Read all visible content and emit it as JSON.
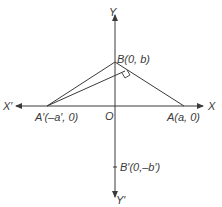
{
  "diagram": {
    "type": "coordinate-geometry",
    "colors": {
      "stroke": "#3a3a3a",
      "text": "#3a3a3a",
      "background": "#ffffff"
    },
    "axes": {
      "x_positive_label": "X",
      "x_negative_label": "X′",
      "y_positive_label": "Y",
      "y_negative_label": "Y′",
      "origin_label": "O"
    },
    "points": {
      "B": {
        "label": "B(0, b)"
      },
      "A": {
        "label": "A(a, 0)"
      },
      "A_prime": {
        "label": "A′(–a′, 0)"
      },
      "B_prime": {
        "label": "B′(0,–b′)"
      }
    },
    "segments": [
      "A′B",
      "BA",
      "A′ to foot of perpendicular on BA"
    ],
    "annotations": [
      "right-angle marker at foot of perpendicular from A′ to BA"
    ]
  }
}
